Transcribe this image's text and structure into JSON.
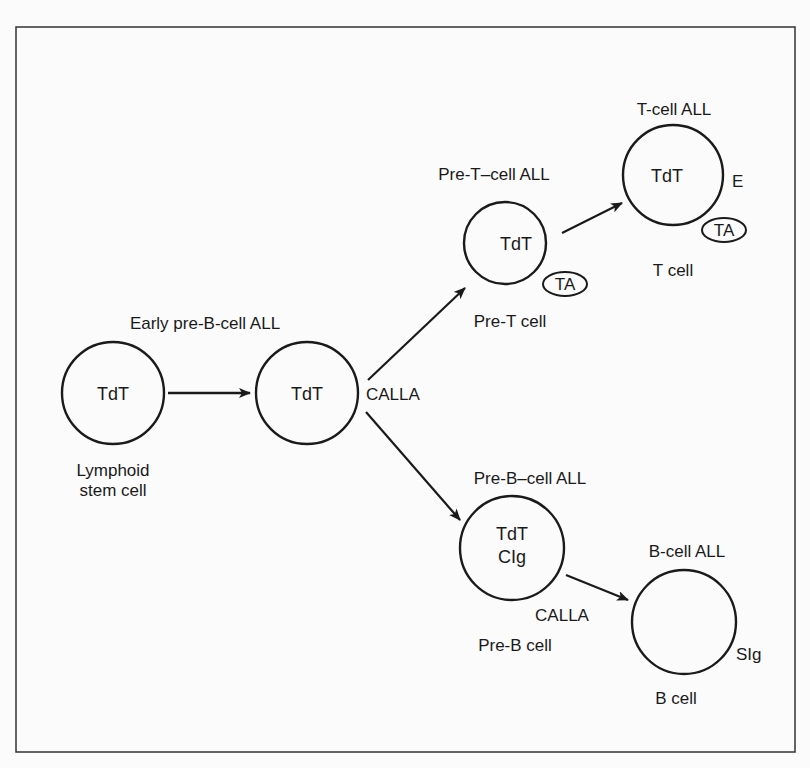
{
  "diagram": {
    "type": "lymphoid differentiation / ALL classification",
    "cells": {
      "stem": {
        "marker": "TdT",
        "caption_line1": "Lymphoid",
        "caption_line2": "stem cell"
      },
      "early_pre_b": {
        "title": "Early pre-B-cell ALL",
        "marker": "TdT",
        "surface": "CALLA"
      },
      "pre_t": {
        "title": "Pre-T–cell ALL",
        "marker": "TdT",
        "surface_badge": "TA",
        "caption": "Pre-T cell"
      },
      "t": {
        "title": "T-cell ALL",
        "marker": "TdT",
        "surface": "E",
        "surface_badge": "TA",
        "caption": "T cell"
      },
      "pre_b": {
        "title": "Pre-B–cell ALL",
        "marker_line1": "TdT",
        "marker_line2": "CIg",
        "surface": "CALLA",
        "caption": "Pre-B cell"
      },
      "b": {
        "title": "B-cell ALL",
        "surface": "SIg",
        "caption": "B cell"
      }
    },
    "edges": [
      {
        "from": "stem",
        "to": "early_pre_b"
      },
      {
        "from": "early_pre_b",
        "to": "pre_t"
      },
      {
        "from": "early_pre_b",
        "to": "pre_b"
      },
      {
        "from": "pre_t",
        "to": "t"
      },
      {
        "from": "pre_b",
        "to": "b"
      }
    ],
    "colors": {
      "ink": "#1a1a1a",
      "background": "#fbfbfb"
    }
  }
}
